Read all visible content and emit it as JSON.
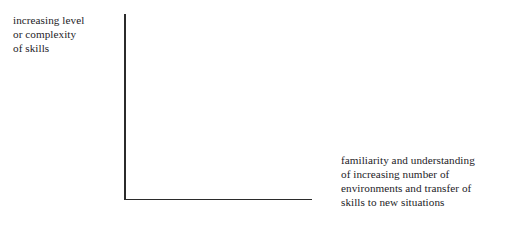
{
  "diagram": {
    "type": "axis-diagram",
    "background_color": "#ffffff",
    "axis_color": "#2b2b2b",
    "text_color": "#24221f",
    "y_axis": {
      "name": "vertical-axis",
      "label_lines": [
        "increasing level",
        "or complexity",
        "of skills"
      ],
      "label_text": "increasing level or complexity of skills",
      "has_arrowhead": false
    },
    "x_axis": {
      "name": "horizontal-axis",
      "label_lines": [
        "familiarity and understanding",
        "of increasing number of",
        "environments and transfer of",
        "skills to new situations"
      ],
      "label_text": "familiarity and understanding of increasing number of environments and transfer of skills to new situations",
      "has_arrowhead": false
    },
    "plot_area": {
      "content": "",
      "empty": true
    }
  }
}
